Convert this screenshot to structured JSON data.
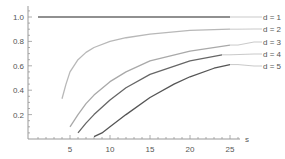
{
  "chart_data": {
    "type": "line",
    "title": "",
    "xlabel": "s",
    "ylabel": "",
    "xlim": [
      0,
      26
    ],
    "ylim": [
      0,
      1.05
    ],
    "grid": false,
    "legend_position": "right (inline labels)",
    "x_ticks": [
      "5",
      "10",
      "15",
      "20",
      "25"
    ],
    "y_ticks": [
      "0.2",
      "0.4",
      "0.6",
      "0.8",
      "1.0"
    ],
    "series": [
      {
        "name": "d = 1",
        "color": "#6b6b6b",
        "points": [
          [
            1,
            1.0
          ],
          [
            5,
            1.0
          ],
          [
            10,
            1.0
          ],
          [
            15,
            1.0
          ],
          [
            20,
            1.0
          ],
          [
            25,
            1.0
          ]
        ]
      },
      {
        "name": "d = 2",
        "color": "#b8b8b8",
        "points": [
          [
            4,
            0.33
          ],
          [
            4.5,
            0.45
          ],
          [
            5,
            0.55
          ],
          [
            6,
            0.65
          ],
          [
            7,
            0.71
          ],
          [
            8,
            0.75
          ],
          [
            10,
            0.8
          ],
          [
            12,
            0.83
          ],
          [
            15,
            0.86
          ],
          [
            20,
            0.89
          ],
          [
            25,
            0.9
          ]
        ]
      },
      {
        "name": "d = 3",
        "color": "#a9a9a9",
        "points": [
          [
            5,
            0.1
          ],
          [
            6,
            0.2
          ],
          [
            7,
            0.29
          ],
          [
            8,
            0.36
          ],
          [
            10,
            0.47
          ],
          [
            12,
            0.55
          ],
          [
            15,
            0.64
          ],
          [
            20,
            0.72
          ],
          [
            25,
            0.77
          ]
        ]
      },
      {
        "name": "d = 4",
        "color": "#666666",
        "points": [
          [
            6,
            0.05
          ],
          [
            7,
            0.13
          ],
          [
            8,
            0.2
          ],
          [
            10,
            0.32
          ],
          [
            12,
            0.42
          ],
          [
            15,
            0.53
          ],
          [
            20,
            0.64
          ],
          [
            24,
            0.69
          ]
        ]
      },
      {
        "name": "d = 5",
        "color": "#555555",
        "points": [
          [
            8,
            0.02
          ],
          [
            9,
            0.05
          ],
          [
            10,
            0.1
          ],
          [
            12,
            0.2
          ],
          [
            15,
            0.34
          ],
          [
            18,
            0.45
          ],
          [
            20,
            0.51
          ],
          [
            23,
            0.58
          ],
          [
            25,
            0.61
          ]
        ]
      }
    ]
  }
}
